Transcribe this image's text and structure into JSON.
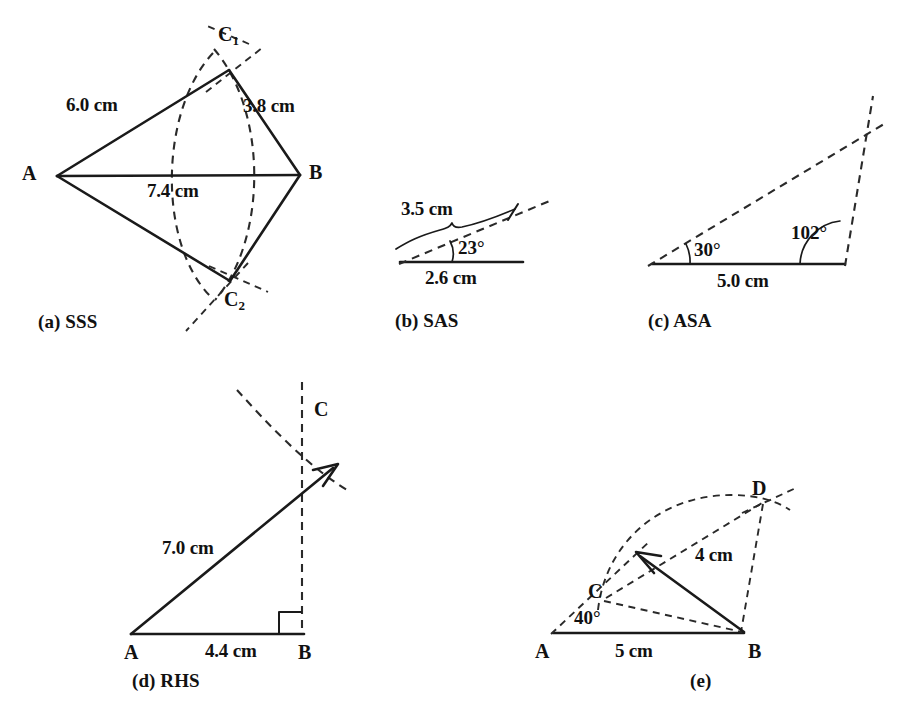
{
  "page": {
    "width": 919,
    "height": 721,
    "background": "#ffffff",
    "ink": "#1a1a1a"
  },
  "figures": [
    {
      "key": "a",
      "caption": "(a) SSS",
      "points": [
        {
          "name": "A",
          "label": "A"
        },
        {
          "name": "B",
          "label": "B"
        },
        {
          "name": "C1",
          "label": "C",
          "subscript": "1"
        },
        {
          "name": "C2",
          "label": "C",
          "subscript": "2"
        }
      ],
      "measurements": [
        {
          "name": "side-AC1",
          "label": "6.0 cm"
        },
        {
          "name": "side-C1B",
          "label": "3.8 cm"
        },
        {
          "name": "side-AB",
          "label": "7.4 cm"
        }
      ]
    },
    {
      "key": "b",
      "caption": "(b) SAS",
      "measurements": [
        {
          "name": "ray-length",
          "label": "3.5 cm"
        },
        {
          "name": "base-length",
          "label": "2.6 cm"
        }
      ],
      "angles": [
        {
          "name": "angle-at-left-vertex",
          "label": "23°"
        }
      ]
    },
    {
      "key": "c",
      "caption": "(c) ASA",
      "measurements": [
        {
          "name": "base-length",
          "label": "5.0 cm"
        }
      ],
      "angles": [
        {
          "name": "angle-left",
          "label": "30°"
        },
        {
          "name": "angle-right",
          "label": "102°"
        }
      ]
    },
    {
      "key": "d",
      "caption": "(d) RHS",
      "points": [
        {
          "name": "A",
          "label": "A"
        },
        {
          "name": "B",
          "label": "B"
        },
        {
          "name": "C",
          "label": "C"
        }
      ],
      "measurements": [
        {
          "name": "hypotenuse-AC",
          "label": "7.0 cm"
        },
        {
          "name": "base-AB",
          "label": "4.4 cm"
        }
      ],
      "angles": [
        {
          "name": "right-angle-at-B",
          "label": "90°",
          "shown_as": "square"
        }
      ]
    },
    {
      "key": "e",
      "caption": "(e)",
      "points": [
        {
          "name": "A",
          "label": "A"
        },
        {
          "name": "B",
          "label": "B"
        },
        {
          "name": "C",
          "label": "C"
        },
        {
          "name": "D",
          "label": "D"
        }
      ],
      "measurements": [
        {
          "name": "base-AB",
          "label": "5 cm"
        },
        {
          "name": "segment-BD",
          "label": "4 cm"
        }
      ],
      "angles": [
        {
          "name": "angle-at-A",
          "label": "40°"
        }
      ]
    }
  ]
}
